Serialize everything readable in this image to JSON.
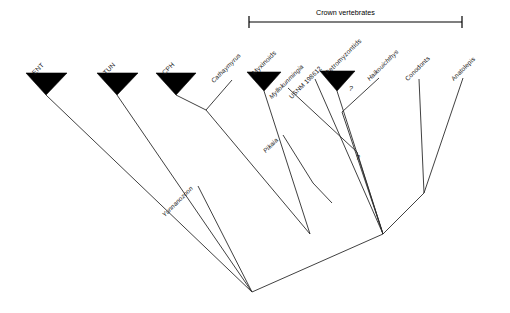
{
  "figure": {
    "type": "cladogram",
    "title": "",
    "background_color": "#ffffff",
    "line_color": "#2b2b2b",
    "clade_fill_color": "#000000"
  },
  "crown_bracket": {
    "label": "Crown vertebrates",
    "x_start": 249,
    "x_end": 462,
    "y": 22
  },
  "collapsed_clades": [
    {
      "id": "ent",
      "label": "ENT",
      "italic": false,
      "apex_x": 46,
      "apex_y": 95,
      "tri_left_x": 26,
      "tri_right_x": 67,
      "tri_top_y": 73
    },
    {
      "id": "tun",
      "label": "TUN",
      "italic": false,
      "apex_x": 117,
      "apex_y": 95,
      "tri_left_x": 97,
      "tri_right_x": 138,
      "tri_top_y": 73
    },
    {
      "id": "cph",
      "label": "CPH",
      "italic": false,
      "apex_x": 176,
      "apex_y": 95,
      "tri_left_x": 156,
      "tri_right_x": 196,
      "tri_top_y": 73
    },
    {
      "id": "myxinoids",
      "label": "Myxinoids",
      "italic": false,
      "apex_x": 264,
      "apex_y": 91,
      "tri_left_x": 247,
      "tri_right_x": 281,
      "tri_top_y": 72
    },
    {
      "id": "petromyzontids",
      "label": "Petromyzontids",
      "italic": false,
      "apex_x": 337,
      "apex_y": 91,
      "tri_left_x": 320,
      "tri_right_x": 355,
      "tri_top_y": 71
    }
  ],
  "terminal_taxa": [
    {
      "id": "cathaymyrus",
      "label": "Cathaymyrus",
      "italic": true,
      "tip_x": 232,
      "tip_y": 80
    },
    {
      "id": "myllokunmingia",
      "label": "Myllokunmingia",
      "italic": true,
      "tip_x": 288,
      "tip_y": 88
    },
    {
      "id": "usnm",
      "label": "USNM 198612",
      "italic": false,
      "tip_x": 315,
      "tip_y": 79
    },
    {
      "id": "haikouichthys",
      "label": "Haikouichthys",
      "italic": true,
      "tip_x": 379,
      "tip_y": 78
    },
    {
      "id": "conodonts",
      "label": "Conodonts",
      "italic": false,
      "tip_x": 419,
      "tip_y": 79
    },
    {
      "id": "anatolepis",
      "label": "Anatolepis",
      "italic": false,
      "tip_x": 463,
      "tip_y": 78
    },
    {
      "id": "pikaia",
      "label": "Pikaia",
      "italic": true,
      "tip_x": 283,
      "tip_y": 135
    },
    {
      "id": "yunnanozoon",
      "label": "Yunnanozoon",
      "italic": true,
      "tip_x": 198,
      "tip_y": 186
    }
  ],
  "uncertainty_marks": [
    {
      "id": "q-petromyzontids",
      "label": "?",
      "x": 349,
      "y": 85
    },
    {
      "id": "q-lower",
      "label": "?",
      "x": 358,
      "y": 155
    }
  ],
  "nodes": [
    {
      "id": "root",
      "x": 252,
      "y": 292
    },
    {
      "id": "n-vertebrates",
      "x": 310,
      "y": 234
    },
    {
      "id": "n-crown",
      "x": 383,
      "y": 234
    },
    {
      "id": "n-conodont",
      "x": 424,
      "y": 193
    },
    {
      "id": "n-cph",
      "x": 206,
      "y": 110
    }
  ],
  "branch_paths": [
    "M46,95 L252,292",
    "M117,95 L252,292",
    "M252,292 L310,234",
    "M310,234 L383,234",
    "M176,95 L206,110",
    "M232,80 L206,110",
    "M206,110 L310,234",
    "M264,91 L310,234",
    "M288,88 L355,153",
    "M355,153 L383,234",
    "M283,135 L310,179",
    "M310,179 L330,200",
    "M315,79 L383,234",
    "M337,91 L383,234",
    "M379,78 L341,110",
    "M341,110 L383,234",
    "M424,193 L383,234",
    "M419,79 L424,193",
    "M463,78 L424,193",
    "M198,186 L252,292"
  ],
  "notes": {
    "legend": "",
    "axis": ""
  }
}
